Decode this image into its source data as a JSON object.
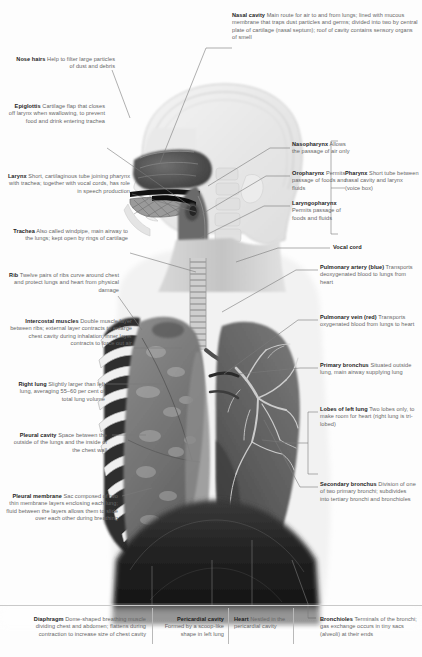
{
  "page": {
    "width": 422,
    "height": 657,
    "background_color": "#fdfdfd",
    "label_color": "#666666",
    "heading_color": "#1d1d1d"
  },
  "artwork": {
    "name": "human-head-and-thorax-cutaway",
    "description": "Greyscale medical illustration of a human head, neck and chest in three-quarter profile, showing the nasal cavity, pharynx, larynx, trachea, rib cage, intercostal muscles, left and right lungs, bronchial tree and diaphragm."
  },
  "labels": {
    "nose_hairs": {
      "title": "Nose hairs",
      "body": "Help to filter large particles of dust and debris"
    },
    "nasal_cavity": {
      "title": "Nasal cavity",
      "body": "Main route for air to and from lungs; lined with mucous membrane that traps dust particles and germs; divided into two by central plate of cartilage (nasal septum); roof of cavity contains sensory organs of smell"
    },
    "epiglottis": {
      "title": "Epiglottis",
      "body": "Cartilage flap that closes off larynx when swallowing, to prevent food and drink entering trachea"
    },
    "larynx": {
      "title": "Larynx",
      "body": "Short, cartilaginous tube joining pharynx with trachea; together with vocal cords, has role in speech production"
    },
    "trachea": {
      "title": "Trachea",
      "body": "Also called windpipe, main airway to the lungs; kept open by rings of cartilage"
    },
    "rib": {
      "title": "Rib",
      "body": "Twelve pairs of ribs curve around chest and protect lungs and heart from physical damage"
    },
    "intercostal_muscles": {
      "title": "Intercostal muscles",
      "body": "Double muscle layer between ribs; external layer contracts to enlarge chest cavity during inhalation; inner layer contracts to force out air"
    },
    "right_lung": {
      "title": "Right lung",
      "body": "Slightly larger than left lung, averaging 55–60 per cent of total lung volume"
    },
    "pleural_cavity": {
      "title": "Pleural cavity",
      "body": "Space between the outside of the lungs and the inside of the chest wall"
    },
    "pleural_membrane": {
      "title": "Pleural membrane",
      "body": "Sac composed of two thin membrane layers enclosing each lung; fluid between the layers allows them to slide over each other during breathing"
    },
    "nasopharynx": {
      "title": "Nasopharynx",
      "body": "Allows the passage of air only"
    },
    "oropharynx": {
      "title": "Oropharynx",
      "body": "Permits passage of foods and fluids"
    },
    "laryngopharynx": {
      "title": "Laryngopharynx",
      "body": "Permits passage of foods and fluids"
    },
    "pharynx": {
      "title": "Pharynx",
      "body": "Short tube between nasal cavity and larynx (voice box)"
    },
    "vocal_cord": {
      "title": "Vocal cord",
      "body": ""
    },
    "pulmonary_artery": {
      "title": "Pulmonary artery (blue)",
      "body": "Transports deoxygenated blood to lungs from heart"
    },
    "pulmonary_vein": {
      "title": "Pulmonary vein (red)",
      "body": "Transports oxygenated blood from lungs to heart"
    },
    "primary_bronchus": {
      "title": "Primary bronchus",
      "body": "Situated outside lung, main airway supplying lung"
    },
    "lobes_of_left_lung": {
      "title": "Lobes of left lung",
      "body": "Two lobes only, to make room for heart (right lung is tri-lobed)"
    },
    "secondary_bronchus": {
      "title": "Secondary bronchus",
      "body": "Division of one of two primary bronchi; subdivides into tertiary bronchi and bronchioles"
    },
    "diaphragm": {
      "title": "Diaphragm",
      "body": "Dome-shaped breathing muscle dividing chest and abdomen; flattens during contraction to increase size of chest cavity"
    },
    "pericardial_cavity": {
      "title": "Pericardial cavity",
      "body": "Formed by a scoop-like shape in left lung"
    },
    "heart": {
      "title": "Heart",
      "body": "Nestled in the pericardial cavity"
    },
    "bronchioles": {
      "title": "Bronchioles",
      "body": "Terminals of the bronchi; gas exchange occurs in tiny sacs (alveoli) at their ends"
    }
  }
}
